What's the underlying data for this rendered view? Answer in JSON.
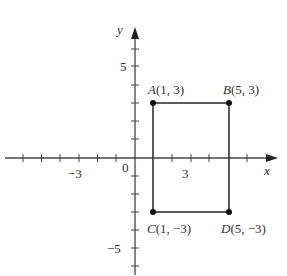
{
  "axes": {
    "x_label": "x",
    "y_label": "y",
    "origin_label": "0",
    "x_tick_label": "3",
    "x_neg_tick_label": "−3",
    "y_tick_label": "5",
    "y_neg_tick_label": "−5"
  },
  "points": [
    {
      "name": "A",
      "coords": "(1, 3)",
      "x": 1,
      "y": 3
    },
    {
      "name": "B",
      "coords": "(5, 3)",
      "x": 5,
      "y": 3
    },
    {
      "name": "C",
      "coords": "(1, −3)",
      "x": 1,
      "y": -3
    },
    {
      "name": "D",
      "coords": "(5, −3)",
      "x": 5,
      "y": -3
    }
  ],
  "colors": {
    "stroke": "#333333",
    "text": "#333333"
  }
}
